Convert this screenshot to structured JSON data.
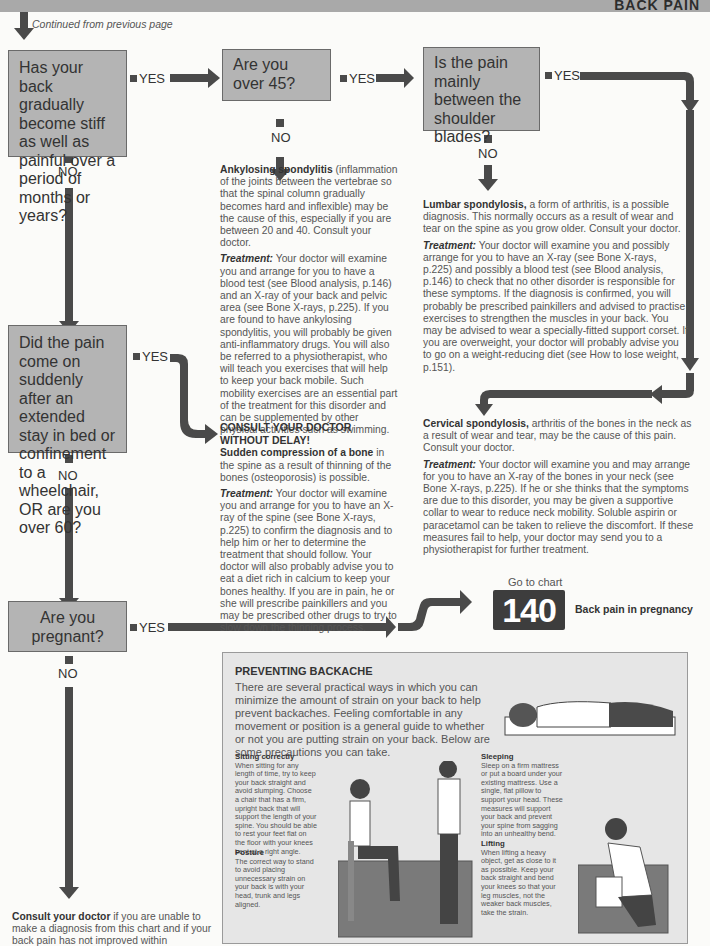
{
  "header": {
    "title": "BACK PAIN",
    "continued": "Continued from previous page"
  },
  "questions": [
    {
      "id": "q1",
      "text": "Has your back gradually become stiff as well as painful over a period of months or years?"
    },
    {
      "id": "q2",
      "text": "Are you over 45?"
    },
    {
      "id": "q3",
      "text": "Is the pain mainly between the shoulder blades?"
    },
    {
      "id": "q4",
      "text": "Did the pain come on suddenly after an extended stay in bed or confinement to a wheelchair, OR are you over 60?"
    },
    {
      "id": "q5",
      "text": "Are you pregnant?"
    }
  ],
  "labels": {
    "yes": "YES",
    "no": "NO"
  },
  "diagnoses": {
    "ankylosing": {
      "title": "Ankylosing spondylitis",
      "text": " (inflammation of the joints between the vertebrae so that the spinal column gradually becomes hard and inflexible) may be the cause of this, especially if you are between 20 and 40. Consult your doctor.",
      "treatment_label": "Treatment:",
      "treatment": " Your doctor will examine you and arrange for you to have a blood test (see Blood analysis, p.146) and an X-ray of your back and pelvic area (see Bone X-rays, p.225). If you are found to have ankylosing spondylitis, you will probably be given anti-inflammatory drugs. You will also be referred to a physiotherapist, who will teach you exercises that will help to keep your back mobile. Such mobility exercises are an essential part of the treatment for this disorder and can be supplemented by other physical activities such as swimming."
    },
    "lumbar": {
      "title": "Lumbar spondylosis,",
      "text": " a form of arthritis, is a possible diagnosis. This normally occurs as a result of wear and tear on the spine as you grow older. Consult your doctor.",
      "treatment_label": "Treatment:",
      "treatment": " Your doctor will examine you and possibly arrange for you to have an X-ray (see Bone X-rays, p.225) and possibly a blood test (see Blood analysis, p.146) to check that no other disorder is responsible for these symptoms. If the diagnosis is confirmed, you will probably be prescribed painkillers and advised to practise exercises to strengthen the muscles in your back. You may be advised to wear a specially-fitted support corset. If you are overweight, your doctor will probably advise you to go on a weight-reducing diet (see How to lose weight, p.151)."
    },
    "cervical": {
      "title": "Cervical spondylosis,",
      "text": " arthritis of the bones in the neck as a result of wear and tear, may be the cause of this pain. Consult your doctor.",
      "treatment_label": "Treatment:",
      "treatment": " Your doctor will examine you and may arrange for you to have an X-ray of the bones in your neck (see Bone X-rays, p.225). If he or she thinks that the symptoms are due to this disorder, you may be given a supportive collar to wear to reduce neck mobility. Soluble aspirin or paracetamol can be taken to relieve the discomfort. If these measures fail to help, your doctor may send you to a physiotherapist for further treatment."
    },
    "osteoporosis": {
      "urgent": "CONSULT YOUR DOCTOR WITHOUT DELAY!",
      "title": "Sudden compression of a bone",
      "text": " in the spine as a result of thinning of the bones (osteoporosis) is possible.",
      "treatment_label": "Treatment:",
      "treatment": " Your doctor will examine you and arrange for you to have an X-ray of the spine (see Bone X-rays, p.225) to confirm the diagnosis and to help him or her to determine the treatment that should follow. Your doctor will also probably advise you to eat a diet rich in calcium to keep your bones healthy. If you are in pain, he or she will prescribe painkillers and you may be prescribed other drugs to try to slow down the thinning process."
    }
  },
  "goto": {
    "label": "Go to chart",
    "number": "140",
    "title": "Back pain in pregnancy"
  },
  "panel": {
    "title": "PREVENTING BACKACHE",
    "intro": "There are several practical ways in which you can minimize the amount of strain on your back to help prevent backaches. Feeling comfortable in any movement or position is a general guide to whether or not you are putting strain on your back. Below are some precautions you can take.",
    "sections": [
      {
        "title": "Sitting correctly",
        "text": "When sitting for any length of time, try to keep your back straight and avoid slumping. Choose a chair that has a firm, upright back that will support the length of your spine. You should be able to rest your feet flat on the floor with your knees bent at a right angle."
      },
      {
        "title": "Posture",
        "text": "The correct way to stand to avoid placing unnecessary strain on your back is with your head, trunk and legs aligned."
      },
      {
        "title": "Sleeping",
        "text": "Sleep on a firm mattress or put a board under your existing mattress. Use a single, flat pillow to support your head. These measures will support your back and prevent your spine from sagging into an unhealthy bend."
      },
      {
        "title": "Lifting",
        "text": "When lifting a heavy object, get as close to it as possible. Keep your back straight and bend your knees so that your leg muscles, not the weaker back muscles, take the strain."
      }
    ]
  },
  "footer": {
    "bold": "Consult your doctor",
    "text": " if you are unable to make a diagnosis from this chart and if your back pain has not improved within"
  }
}
